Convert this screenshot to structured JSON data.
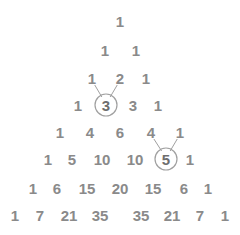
{
  "colors": {
    "number": "#8a8a8a",
    "highlight": "#6e6e6e",
    "line": "#a0a0a0",
    "background": "#ffffff"
  },
  "rows": [
    [
      1
    ],
    [
      1,
      1
    ],
    [
      1,
      2,
      1
    ],
    [
      1,
      3,
      3,
      1
    ],
    [
      1,
      4,
      6,
      4,
      1
    ],
    [
      1,
      5,
      10,
      10,
      5,
      1
    ],
    [
      1,
      6,
      15,
      20,
      15,
      6,
      1
    ],
    [
      1,
      7,
      21,
      35,
      35,
      21,
      7,
      1
    ]
  ],
  "highlights": [
    {
      "row": 3,
      "index": 1,
      "value": 3,
      "parents": [
        [
          2,
          0
        ],
        [
          2,
          1
        ]
      ]
    },
    {
      "row": 5,
      "index": 4,
      "value": 5,
      "parents": [
        [
          4,
          3
        ],
        [
          4,
          4
        ]
      ]
    }
  ]
}
